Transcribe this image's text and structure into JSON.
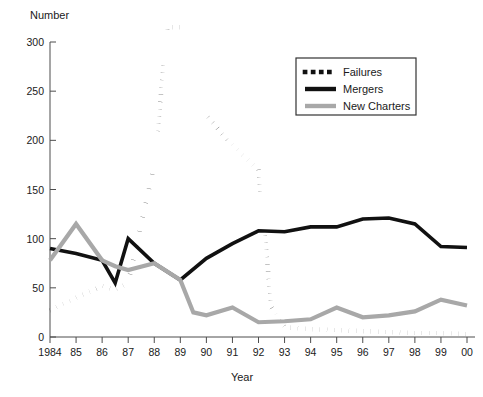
{
  "chart_data": {
    "type": "line",
    "title": "",
    "ylabel": "Number",
    "xlabel": "Year",
    "grid": false,
    "legend_position": "top-right",
    "ylim": [
      0,
      300
    ],
    "yticks": [
      0,
      50,
      100,
      150,
      200,
      250,
      300
    ],
    "ytick_labels": [
      "0",
      "50",
      "100",
      "150",
      "200",
      "250",
      "300"
    ],
    "categories": [
      "1984",
      "85",
      "86",
      "87",
      "88",
      "89",
      "90",
      "91",
      "92",
      "93",
      "94",
      "95",
      "96",
      "97",
      "98",
      "99",
      "00"
    ],
    "x": [
      1984,
      1985,
      1986,
      1987,
      1988,
      1989,
      1990,
      1991,
      1992,
      1993,
      1994,
      1995,
      1996,
      1997,
      1998,
      1999,
      2000
    ],
    "series": [
      {
        "name": "Failures",
        "style": "dotted",
        "color": "#111111",
        "values": [
          27,
          40,
          52,
          55,
          175,
          315,
          225,
          195,
          170,
          10,
          8,
          7,
          6,
          5,
          4,
          4,
          3
        ],
        "midpoints": [
          {
            "x": 1986.5,
            "y": 48
          },
          {
            "x": 1988.5,
            "y": 315
          },
          {
            "x": 1992.5,
            "y": 30
          }
        ]
      },
      {
        "name": "Mergers",
        "style": "solid",
        "color": "#111111",
        "values": [
          90,
          85,
          78,
          100,
          75,
          58,
          80,
          95,
          108,
          107,
          112,
          112,
          120,
          121,
          115,
          92,
          91
        ],
        "midpoints": [
          {
            "x": 1986.5,
            "y": 55
          }
        ]
      },
      {
        "name": "New Charters",
        "style": "solid",
        "color": "#a8a8a8",
        "values": [
          78,
          115,
          78,
          68,
          75,
          58,
          22,
          30,
          15,
          16,
          18,
          30,
          20,
          22,
          26,
          38,
          32
        ],
        "midpoints": [
          {
            "x": 1986.5,
            "y": 72
          },
          {
            "x": 1989.5,
            "y": 25
          }
        ]
      }
    ]
  },
  "legend": {
    "entries": [
      {
        "label": "Failures",
        "swatch": "dotted-line-swatch"
      },
      {
        "label": "Mergers",
        "swatch": "solid-black-line-swatch"
      },
      {
        "label": "New Charters",
        "swatch": "solid-gray-line-swatch"
      }
    ]
  }
}
